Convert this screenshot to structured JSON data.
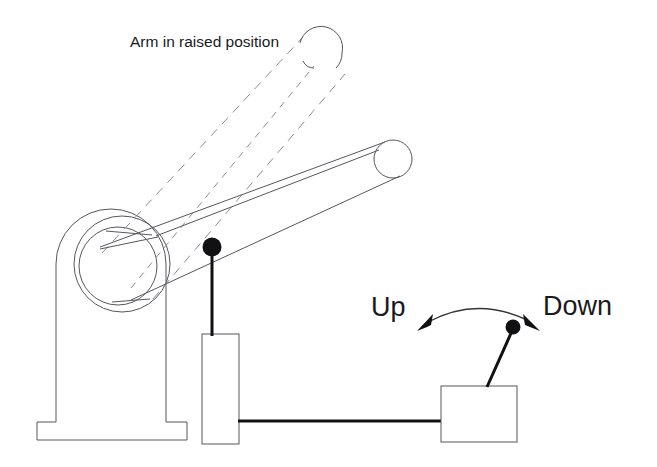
{
  "figure": {
    "title_caption": "Arm in raised position",
    "labels": {
      "up": "Up",
      "down": "Down"
    },
    "colors": {
      "background": "#ffffff",
      "outline": "#56565c",
      "dashed_outline": "#8d8d93",
      "solid_fill": "#111114",
      "text": "#1a1a1d",
      "arc": "#333338"
    },
    "parts": {
      "base_pedestal": "base-pedestal",
      "base_foot": "base-foot",
      "pivot_outer_circle": "pivot-outer-circle",
      "pivot_inner_circle": "pivot-inner-circle",
      "boom_arm": "boom-arm",
      "boom_arm_end_cap": "boom-arm-end-cap",
      "raised_arm_ghost": "raised-arm-ghost",
      "raised_arm_end_cap": "raised-arm-end-cap",
      "support_post": "support-post",
      "post_ball_knob": "post-ball-knob",
      "control_cable": "control-cable",
      "control_box": "control-box",
      "joystick_lever": "joystick-lever",
      "joystick_knob": "joystick-knob",
      "motion_arc_arrow": "motion-arc-arrow"
    }
  }
}
